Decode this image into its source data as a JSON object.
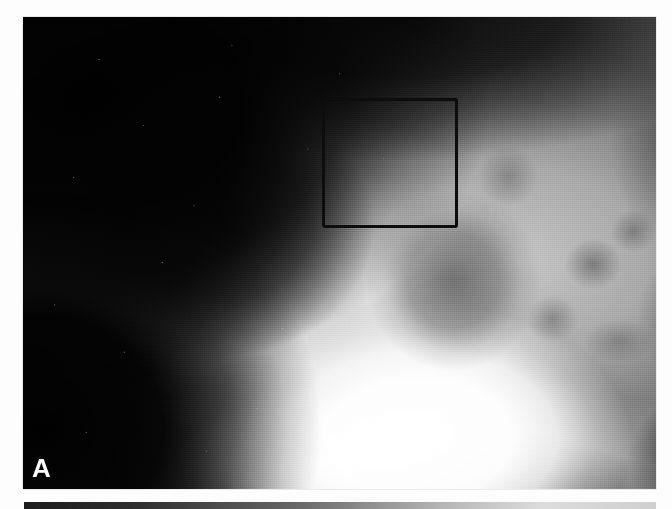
{
  "page": {
    "background_color": "#fdfdfd",
    "width": 672,
    "height": 509
  },
  "figure": {
    "panel_label": "A",
    "panel_label_color": "#ffffff",
    "modality": "radiograph",
    "image_kind": "grayscale-xray",
    "annotations": [
      {
        "type": "roi-rectangle",
        "name": "region-of-interest-box",
        "color": "#0d0d0d",
        "stroke_px": 3,
        "x": 322,
        "y": 98,
        "width": 136,
        "height": 130
      }
    ],
    "panel_bounds": {
      "x": 23,
      "y": 17,
      "width": 633,
      "height": 472
    }
  },
  "next_figure": {
    "name": "following-panel-clipped",
    "bounds": {
      "x": 24,
      "y": 502,
      "width": 632,
      "height": 7
    }
  }
}
